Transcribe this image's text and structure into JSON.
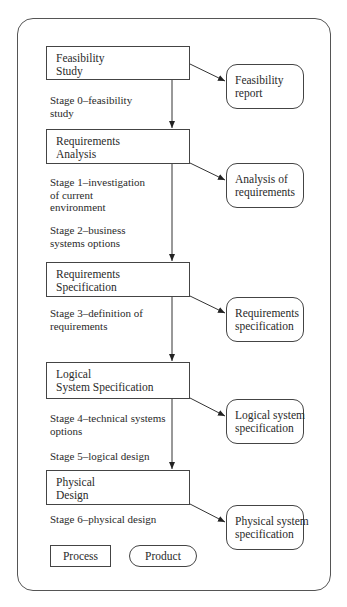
{
  "diagram": {
    "processes": [
      {
        "lines": [
          "Feasibility",
          "Study"
        ]
      },
      {
        "lines": [
          "Requirements",
          "Analysis"
        ]
      },
      {
        "lines": [
          "Requirements",
          "Specification"
        ]
      },
      {
        "lines": [
          "Logical",
          "System Specification"
        ]
      },
      {
        "lines": [
          "Physical",
          "Design"
        ]
      }
    ],
    "products": [
      {
        "lines": [
          "Feasibility",
          "report"
        ]
      },
      {
        "lines": [
          "Analysis of",
          "requirements"
        ]
      },
      {
        "lines": [
          "Requirements",
          "specification"
        ]
      },
      {
        "lines": [
          "Logical system",
          "specification"
        ]
      },
      {
        "lines": [
          "Physical system",
          "specification"
        ]
      }
    ],
    "stages": [
      {
        "lines": [
          "Stage 0–feasibility",
          "study"
        ]
      },
      {
        "lines": [
          "Stage 1–investigation",
          "of current",
          "environment"
        ]
      },
      {
        "lines": [
          "Stage 2–business",
          "systems options"
        ]
      },
      {
        "lines": [
          "Stage 3–definition of",
          "requirements"
        ]
      },
      {
        "lines": [
          "Stage 4–technical systems",
          "options"
        ]
      },
      {
        "lines": [
          "Stage 5–logical design"
        ]
      },
      {
        "lines": [
          "Stage 6–physical design"
        ]
      }
    ],
    "legend": {
      "process_label": "Process",
      "product_label": "Product"
    }
  }
}
